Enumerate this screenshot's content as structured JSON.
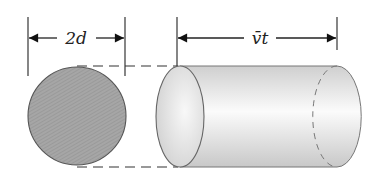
{
  "diagram": {
    "left_dimension": {
      "label": "2d",
      "meaning": "diameter of collision cross-section"
    },
    "right_dimension": {
      "label": "v̄t",
      "meaning": "length of cylinder swept in time t"
    },
    "shapes": {
      "cross_section": "shaded circle",
      "cylinder": "light gray cylinder with dashed hidden back edge",
      "connectors": "dashed tangent lines linking circle to cylinder"
    },
    "colors": {
      "circle_fill": "#a9a9a9",
      "cylinder_fill": "#e6e6e6",
      "stroke": "#555555",
      "dimension_line": "#222222"
    }
  }
}
